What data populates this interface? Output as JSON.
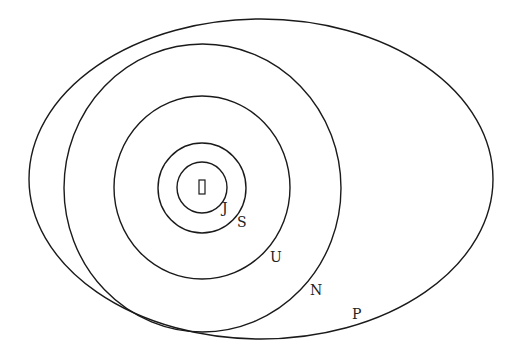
{
  "diagram": {
    "center_marker": "sun",
    "orbits": [
      {
        "id": "jupiter",
        "label": "J"
      },
      {
        "id": "saturn",
        "label": "S"
      },
      {
        "id": "uranus",
        "label": "U"
      },
      {
        "id": "neptune",
        "label": "N"
      },
      {
        "id": "pluto",
        "label": "P"
      }
    ],
    "colors": {
      "stroke": "#1a1a1a",
      "background": "#ffffff",
      "text": "#222222"
    }
  }
}
